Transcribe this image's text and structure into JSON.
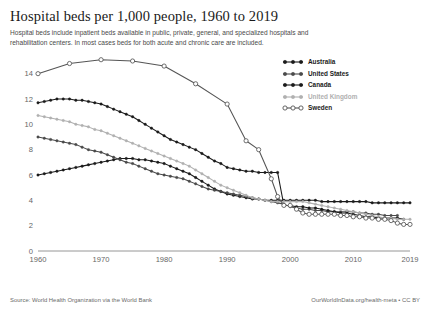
{
  "header": {
    "title": "Hospital beds per 1,000 people, 1960 to 2019",
    "subtitle": "Hospital beds include inpatient beds available in public, private, general, and specialized hospitals and rehabilitation centers. In most cases beds for both acute and chronic care are included."
  },
  "footer": {
    "source": "Source: World Health Organization via the World Bank",
    "credit": "OurWorldInData.org/health-meta • CC BY"
  },
  "chart_data": {
    "type": "line",
    "title": "Hospital beds per 1,000 people, 1960 to 2019",
    "xlabel": "",
    "ylabel": "",
    "xlim": [
      1960,
      2019
    ],
    "ylim": [
      0,
      15
    ],
    "xticks": [
      1960,
      1970,
      1980,
      1990,
      2000,
      2010,
      2019
    ],
    "yticks": [
      0,
      2,
      4,
      6,
      8,
      10,
      12,
      14
    ],
    "xtick_labels": [
      "1960",
      "1970",
      "1980",
      "1990",
      "2000",
      "2010",
      "2019"
    ],
    "ytick_labels": [
      "0",
      "2",
      "4",
      "6",
      "8",
      "10",
      "12",
      "14"
    ],
    "grid": false,
    "legend_position": "top-right",
    "series": [
      {
        "name": "Australia",
        "color": "#1a1a1a",
        "marker": "filled-circle",
        "x": [
          1960,
          1961,
          1962,
          1963,
          1964,
          1965,
          1966,
          1967,
          1968,
          1969,
          1970,
          1971,
          1972,
          1973,
          1974,
          1975,
          1976,
          1977,
          1978,
          1979,
          1980,
          1981,
          1982,
          1983,
          1984,
          1985,
          1986,
          1987,
          1988,
          1989,
          1990,
          1991,
          1992,
          1993,
          1994,
          1995,
          1996,
          1997,
          1998,
          1999,
          2000,
          2001,
          2002,
          2003,
          2004,
          2005,
          2006,
          2007,
          2008,
          2009,
          2010,
          2011,
          2012,
          2013,
          2014,
          2015,
          2016,
          2017,
          2018,
          2019
        ],
        "y": [
          6.0,
          6.1,
          6.2,
          6.3,
          6.4,
          6.5,
          6.6,
          6.7,
          6.8,
          6.9,
          7.0,
          7.1,
          7.2,
          7.3,
          7.3,
          7.3,
          7.2,
          7.2,
          7.1,
          7.0,
          6.9,
          6.7,
          6.5,
          6.3,
          6.1,
          5.8,
          5.5,
          5.2,
          4.9,
          4.7,
          4.5,
          4.4,
          4.3,
          4.2,
          4.1,
          4.1,
          4.0,
          4.0,
          4.0,
          4.0,
          4.0,
          4.0,
          4.0,
          4.0,
          4.0,
          3.9,
          3.9,
          3.9,
          3.9,
          3.9,
          3.9,
          3.9,
          3.9,
          3.8,
          3.8,
          3.8,
          3.8,
          3.8,
          3.8,
          3.8
        ]
      },
      {
        "name": "United States",
        "color": "#4a4a4a",
        "marker": "filled-circle",
        "x": [
          1960,
          1961,
          1962,
          1963,
          1964,
          1965,
          1966,
          1967,
          1968,
          1969,
          1970,
          1971,
          1972,
          1973,
          1974,
          1975,
          1976,
          1977,
          1978,
          1979,
          1980,
          1981,
          1982,
          1983,
          1984,
          1985,
          1986,
          1987,
          1988,
          1989,
          1990,
          1991,
          1992,
          1993,
          1994,
          1995,
          1996,
          1997,
          1998,
          1999,
          2000,
          2001,
          2002,
          2003,
          2004,
          2005,
          2006,
          2007,
          2008,
          2009,
          2010,
          2011,
          2012,
          2013,
          2014,
          2015,
          2016,
          2017
        ],
        "y": [
          9.0,
          8.9,
          8.8,
          8.7,
          8.6,
          8.5,
          8.4,
          8.2,
          8.0,
          7.9,
          7.8,
          7.6,
          7.4,
          7.2,
          7.0,
          6.9,
          6.7,
          6.5,
          6.3,
          6.1,
          6.0,
          5.9,
          5.8,
          5.7,
          5.5,
          5.3,
          5.1,
          4.9,
          4.8,
          4.7,
          4.6,
          4.5,
          4.4,
          4.3,
          4.2,
          4.1,
          4.0,
          3.9,
          3.8,
          3.7,
          3.5,
          3.4,
          3.3,
          3.3,
          3.2,
          3.2,
          3.1,
          3.1,
          3.1,
          3.1,
          3.1,
          3.0,
          3.0,
          2.9,
          2.9,
          2.8,
          2.8,
          2.8
        ]
      },
      {
        "name": "Canada",
        "color": "#1a1a1a",
        "marker": "filled-circle",
        "x": [
          1960,
          1961,
          1962,
          1963,
          1964,
          1965,
          1966,
          1967,
          1968,
          1969,
          1970,
          1971,
          1972,
          1973,
          1974,
          1975,
          1976,
          1977,
          1978,
          1979,
          1980,
          1981,
          1982,
          1983,
          1984,
          1985,
          1986,
          1987,
          1988,
          1989,
          1990,
          1991,
          1992,
          1993,
          1994,
          1995,
          1996,
          1997,
          1998,
          1999,
          2000,
          2001,
          2002,
          2003,
          2004,
          2005,
          2006,
          2007,
          2008,
          2009,
          2010,
          2011,
          2012,
          2013,
          2014,
          2015,
          2016,
          2017,
          2018
        ],
        "y": [
          11.7,
          11.8,
          11.9,
          12.0,
          12.0,
          12.0,
          11.9,
          11.9,
          11.8,
          11.7,
          11.6,
          11.4,
          11.2,
          11.0,
          10.8,
          10.6,
          10.3,
          10.0,
          9.7,
          9.4,
          9.1,
          8.8,
          8.6,
          8.4,
          8.2,
          8.0,
          7.7,
          7.4,
          7.1,
          6.9,
          6.6,
          6.5,
          6.4,
          6.3,
          6.3,
          6.2,
          6.2,
          6.2,
          6.2,
          3.6,
          3.6,
          3.5,
          3.5,
          3.4,
          3.4,
          3.3,
          3.2,
          3.1,
          3.0,
          3.0,
          2.9,
          2.8,
          2.7,
          2.7,
          2.6,
          2.6,
          2.6,
          2.6,
          2.5
        ]
      },
      {
        "name": "United Kingdom",
        "color": "#b0b0b0",
        "marker": "filled-circle",
        "x": [
          1960,
          1961,
          1962,
          1963,
          1964,
          1965,
          1966,
          1967,
          1968,
          1969,
          1970,
          1971,
          1972,
          1973,
          1974,
          1975,
          1976,
          1977,
          1978,
          1979,
          1980,
          1981,
          1982,
          1983,
          1984,
          1985,
          1986,
          1987,
          1988,
          1989,
          1990,
          1991,
          1992,
          1993,
          1994,
          1995,
          1996,
          1997,
          1998,
          1999,
          2000,
          2001,
          2002,
          2003,
          2004,
          2005,
          2006,
          2007,
          2008,
          2009,
          2010,
          2011,
          2012,
          2013,
          2014,
          2015,
          2016,
          2017,
          2018,
          2019
        ],
        "y": [
          10.7,
          10.6,
          10.5,
          10.4,
          10.3,
          10.2,
          10.0,
          9.9,
          9.8,
          9.6,
          9.5,
          9.3,
          9.1,
          8.9,
          8.7,
          8.5,
          8.3,
          8.1,
          7.9,
          7.7,
          7.5,
          7.3,
          7.1,
          6.9,
          6.7,
          6.4,
          6.1,
          5.8,
          5.5,
          5.2,
          5.0,
          4.8,
          4.6,
          4.4,
          4.2,
          4.1,
          4.0,
          3.9,
          3.9,
          3.9,
          3.9,
          3.9,
          3.9,
          3.8,
          3.7,
          3.6,
          3.5,
          3.4,
          3.3,
          3.2,
          3.1,
          3.0,
          2.9,
          2.8,
          2.7,
          2.6,
          2.6,
          2.5,
          2.5,
          2.5
        ]
      },
      {
        "name": "Sweden",
        "color": "#555555",
        "marker": "open-circle",
        "x": [
          1960,
          1965,
          1970,
          1975,
          1980,
          1985,
          1990,
          1993,
          1995,
          1997,
          1998,
          1999,
          2000,
          2001,
          2002,
          2003,
          2004,
          2005,
          2006,
          2007,
          2008,
          2009,
          2010,
          2011,
          2012,
          2013,
          2014,
          2015,
          2016,
          2017,
          2018,
          2019
        ],
        "y": [
          14.0,
          14.8,
          15.1,
          15.0,
          14.6,
          13.2,
          11.6,
          8.7,
          8.0,
          5.7,
          4.3,
          3.6,
          3.6,
          3.3,
          3.0,
          2.9,
          2.9,
          2.9,
          2.9,
          2.9,
          2.8,
          2.8,
          2.7,
          2.7,
          2.6,
          2.6,
          2.5,
          2.5,
          2.4,
          2.2,
          2.1,
          2.1
        ]
      }
    ]
  },
  "legend": {
    "items": [
      {
        "label": "Australia",
        "color": "#1a1a1a",
        "marker": "filled-circle"
      },
      {
        "label": "United States",
        "color": "#4a4a4a",
        "marker": "filled-circle"
      },
      {
        "label": "Canada",
        "color": "#1a1a1a",
        "marker": "filled-circle"
      },
      {
        "label": "United Kingdom",
        "color": "#b0b0b0",
        "marker": "filled-circle"
      },
      {
        "label": "Sweden",
        "color": "#555555",
        "marker": "open-circle"
      }
    ]
  }
}
